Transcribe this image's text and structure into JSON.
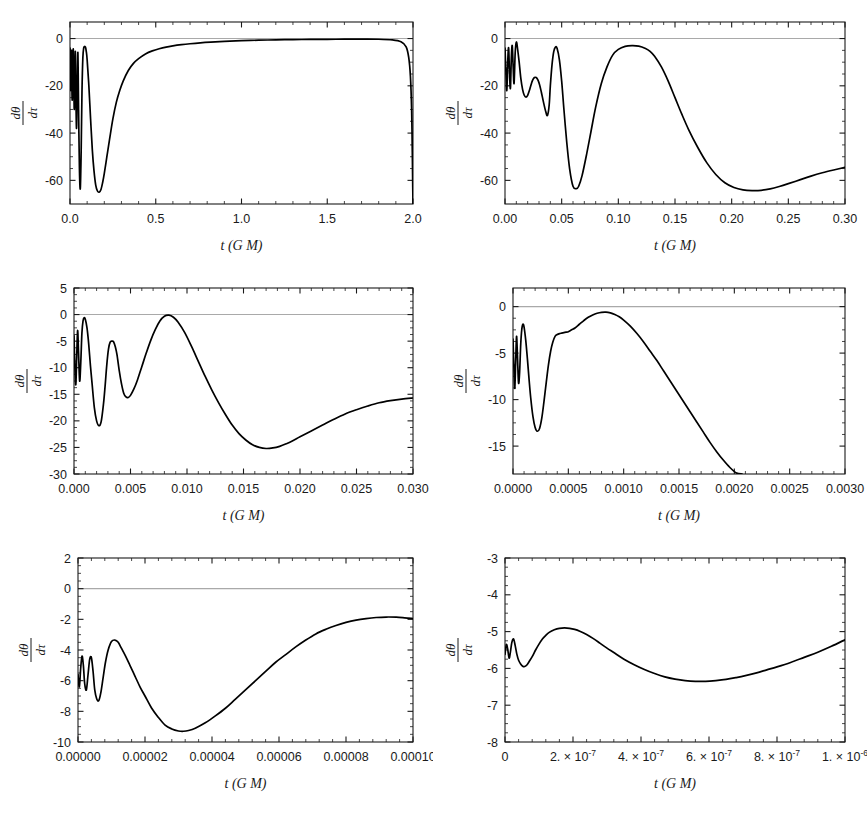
{
  "figure": {
    "background": "#ffffff",
    "curve_color": "#000000",
    "axis_color": "#1a1a1a",
    "zero_line_color": "#a9a9a9",
    "panel_count": 6,
    "layout": "3 rows x 2 columns"
  },
  "chart_data": [
    {
      "type": "line",
      "panel": 1,
      "title": "",
      "xlabel": "t (G M)",
      "ylabel_numerator": "dθ",
      "ylabel_denominator": "dτ",
      "ylabel": "dθ/dτ",
      "xlim": [
        0.0,
        2.0
      ],
      "ylim": [
        -70,
        7
      ],
      "xticks": [
        0.0,
        0.5,
        1.0,
        1.5,
        2.0
      ],
      "xticklabels": [
        "0.0",
        "0.5",
        "1.0",
        "1.5",
        "2.0"
      ],
      "yticks": [
        0,
        -20,
        -40,
        -60
      ],
      "yticklabels": [
        "0",
        "-20",
        "-40",
        "-60"
      ],
      "xminor_per_interval": 5,
      "yminor_per_interval": 4,
      "grid": false,
      "legend": null,
      "zero_line": 0,
      "x": [
        0.0,
        0.002,
        0.004,
        0.006,
        0.008,
        0.01,
        0.013,
        0.016,
        0.019,
        0.022,
        0.025,
        0.028,
        0.031,
        0.034,
        0.038,
        0.042,
        0.046,
        0.05,
        0.055,
        0.06,
        0.065,
        0.07,
        0.075,
        0.08,
        0.085,
        0.09,
        0.095,
        0.1,
        0.11,
        0.12,
        0.13,
        0.14,
        0.15,
        0.16,
        0.17,
        0.18,
        0.19,
        0.2,
        0.215,
        0.23,
        0.25,
        0.27,
        0.29,
        0.31,
        0.34,
        0.37,
        0.4,
        0.44,
        0.48,
        0.52,
        0.56,
        0.6,
        0.65,
        0.7,
        0.76,
        0.82,
        0.9,
        1.0,
        1.1,
        1.2,
        1.3,
        1.4,
        1.5,
        1.6,
        1.7,
        1.8,
        1.88,
        1.93,
        1.96,
        1.975,
        1.985,
        1.992,
        1.996,
        1.998,
        2.0
      ],
      "y": [
        -4.0,
        -12.0,
        -22.0,
        -14.0,
        -5.0,
        -16.0,
        -26.0,
        -12.0,
        -4.5,
        -18.0,
        -30.0,
        -16.0,
        -5.5,
        -22.0,
        -38.0,
        -20.0,
        -6.0,
        -30.0,
        -55.0,
        -63.5,
        -48.0,
        -22.0,
        -8.0,
        -4.0,
        -3.4,
        -3.6,
        -5.5,
        -9.0,
        -20.0,
        -34.0,
        -47.0,
        -56.0,
        -62.0,
        -64.5,
        -65.0,
        -64.0,
        -61.0,
        -57.0,
        -50.0,
        -43.0,
        -34.0,
        -27.0,
        -22.0,
        -18.0,
        -13.5,
        -10.5,
        -8.5,
        -6.5,
        -5.2,
        -4.3,
        -3.6,
        -3.1,
        -2.6,
        -2.2,
        -1.8,
        -1.5,
        -1.2,
        -0.9,
        -0.7,
        -0.55,
        -0.45,
        -0.38,
        -0.32,
        -0.28,
        -0.26,
        -0.3,
        -0.6,
        -1.4,
        -3.5,
        -8.0,
        -16.0,
        -30.0,
        -48.0,
        -60.0,
        -70.0
      ]
    },
    {
      "type": "line",
      "panel": 2,
      "title": "",
      "xlabel": "t (G M)",
      "ylabel_numerator": "dθ",
      "ylabel_denominator": "dτ",
      "ylabel": "dθ/dτ",
      "xlim": [
        0.0,
        0.3
      ],
      "ylim": [
        -70,
        7
      ],
      "xticks": [
        0.0,
        0.05,
        0.1,
        0.15,
        0.2,
        0.25,
        0.3
      ],
      "xticklabels": [
        "0.00",
        "0.05",
        "0.10",
        "0.15",
        "0.20",
        "0.25",
        "0.30"
      ],
      "yticks": [
        0,
        -20,
        -40,
        -60
      ],
      "yticklabels": [
        "0",
        "-20",
        "-40",
        "-60"
      ],
      "xminor_per_interval": 5,
      "yminor_per_interval": 4,
      "grid": false,
      "legend": null,
      "zero_line": 0,
      "x": [
        0.0,
        0.0008,
        0.0016,
        0.0024,
        0.0032,
        0.004,
        0.0048,
        0.0056,
        0.0064,
        0.0072,
        0.008,
        0.009,
        0.01,
        0.011,
        0.0125,
        0.014,
        0.0155,
        0.017,
        0.0185,
        0.02,
        0.0215,
        0.023,
        0.0245,
        0.026,
        0.0275,
        0.029,
        0.0305,
        0.032,
        0.034,
        0.036,
        0.0375,
        0.039,
        0.04,
        0.0415,
        0.043,
        0.0445,
        0.046,
        0.048,
        0.05,
        0.052,
        0.0545,
        0.057,
        0.06,
        0.063,
        0.065,
        0.068,
        0.072,
        0.076,
        0.08,
        0.085,
        0.09,
        0.095,
        0.1,
        0.106,
        0.112,
        0.118,
        0.124,
        0.128,
        0.132,
        0.138,
        0.144,
        0.15,
        0.156,
        0.162,
        0.17,
        0.178,
        0.186,
        0.194,
        0.202,
        0.21,
        0.218,
        0.226,
        0.234,
        0.242,
        0.25,
        0.26,
        0.27,
        0.28,
        0.29,
        0.3
      ],
      "y": [
        -4.0,
        -14.0,
        -22.0,
        -10.0,
        -4.0,
        -15.0,
        -21.0,
        -8.0,
        -3.0,
        -12.0,
        -19.0,
        -6.0,
        -1.5,
        -4.0,
        -10.0,
        -17.0,
        -21.5,
        -24.0,
        -24.8,
        -24.0,
        -22.0,
        -19.5,
        -17.5,
        -16.5,
        -16.5,
        -17.5,
        -19.5,
        -22.5,
        -27.0,
        -31.0,
        -32.5,
        -28.0,
        -20.0,
        -11.0,
        -5.5,
        -3.6,
        -4.2,
        -9.0,
        -18.0,
        -30.0,
        -44.0,
        -55.0,
        -62.5,
        -63.5,
        -62.5,
        -58.0,
        -49.0,
        -39.0,
        -29.0,
        -19.0,
        -12.0,
        -7.0,
        -4.6,
        -3.3,
        -3.0,
        -3.2,
        -4.2,
        -5.4,
        -7.5,
        -12.0,
        -18.0,
        -25.0,
        -32.0,
        -38.5,
        -46.0,
        -52.5,
        -57.5,
        -61.0,
        -63.0,
        -64.0,
        -64.3,
        -64.2,
        -63.6,
        -62.6,
        -61.4,
        -59.8,
        -58.2,
        -56.8,
        -55.6,
        -54.5
      ]
    },
    {
      "type": "line",
      "panel": 3,
      "title": "",
      "xlabel": "t (G M)",
      "ylabel_numerator": "dθ",
      "ylabel_denominator": "dτ",
      "ylabel": "dθ/dτ",
      "xlim": [
        0.0,
        0.03
      ],
      "ylim": [
        -30,
        5
      ],
      "xticks": [
        0.0,
        0.005,
        0.01,
        0.015,
        0.02,
        0.025,
        0.03
      ],
      "xticklabels": [
        "0.000",
        "0.005",
        "0.010",
        "0.015",
        "0.020",
        "0.025",
        "0.030"
      ],
      "yticks": [
        5,
        0,
        -5,
        -10,
        -15,
        -20,
        -25,
        -30
      ],
      "yticklabels": [
        "5",
        "0",
        "-5",
        "-10",
        "-15",
        "-20",
        "-25",
        "-30"
      ],
      "xminor_per_interval": 5,
      "yminor_per_interval": 4,
      "grid": false,
      "legend": null,
      "zero_line": 0,
      "x": [
        0.0,
        8e-05,
        0.00016,
        0.00024,
        0.00032,
        0.0004,
        0.0005,
        0.0006,
        0.0007,
        0.0008,
        0.0009,
        0.001,
        0.00115,
        0.0013,
        0.00145,
        0.0016,
        0.0018,
        0.002,
        0.0022,
        0.0024,
        0.0026,
        0.00275,
        0.0029,
        0.00305,
        0.0032,
        0.00335,
        0.0035,
        0.00365,
        0.0038,
        0.004,
        0.0042,
        0.0044,
        0.0046,
        0.0048,
        0.005,
        0.0053,
        0.0056,
        0.006,
        0.0064,
        0.0068,
        0.0072,
        0.0076,
        0.008,
        0.0084,
        0.0088,
        0.0092,
        0.0098,
        0.0104,
        0.011,
        0.0116,
        0.0122,
        0.0128,
        0.0134,
        0.014,
        0.0146,
        0.0152,
        0.0158,
        0.0164,
        0.017,
        0.0176,
        0.0182,
        0.0188,
        0.0194,
        0.02,
        0.021,
        0.022,
        0.023,
        0.024,
        0.025,
        0.026,
        0.027,
        0.028,
        0.029,
        0.03
      ],
      "y": [
        -4.0,
        -10.0,
        -13.2,
        -8.0,
        -3.0,
        -7.0,
        -12.5,
        -9.0,
        -3.5,
        -1.2,
        -0.6,
        -0.9,
        -2.5,
        -5.5,
        -9.5,
        -13.0,
        -17.5,
        -20.0,
        -20.9,
        -20.2,
        -17.0,
        -13.5,
        -9.5,
        -6.5,
        -5.2,
        -5.0,
        -5.1,
        -6.0,
        -7.5,
        -10.5,
        -13.0,
        -14.8,
        -15.5,
        -15.6,
        -15.2,
        -14.0,
        -12.4,
        -9.8,
        -7.2,
        -4.8,
        -2.8,
        -1.2,
        -0.3,
        -0.1,
        -0.5,
        -1.4,
        -3.4,
        -6.0,
        -8.8,
        -11.6,
        -14.2,
        -16.6,
        -18.8,
        -20.8,
        -22.4,
        -23.6,
        -24.5,
        -25.0,
        -25.2,
        -25.1,
        -24.8,
        -24.3,
        -23.7,
        -23.0,
        -21.9,
        -20.8,
        -19.7,
        -18.7,
        -17.9,
        -17.2,
        -16.6,
        -16.2,
        -15.9,
        -15.7
      ]
    },
    {
      "type": "line",
      "panel": 4,
      "title": "",
      "xlabel": "t (G M)",
      "ylabel_numerator": "dθ",
      "ylabel_denominator": "dτ",
      "ylabel": "dθ/dτ",
      "xlim": [
        0.0,
        0.003
      ],
      "ylim": [
        -18,
        2
      ],
      "xticks": [
        0.0,
        0.0005,
        0.001,
        0.0015,
        0.002,
        0.0025,
        0.003
      ],
      "xticklabels": [
        "0.0000",
        "0.0005",
        "0.0010",
        "0.0015",
        "0.0020",
        "0.0025",
        "0.0030"
      ],
      "yticks": [
        0,
        -5,
        -10,
        -15
      ],
      "yticklabels": [
        "0",
        "-5",
        "-10",
        "-15"
      ],
      "xminor_per_interval": 5,
      "yminor_per_interval": 4,
      "grid": false,
      "legend": null,
      "zero_line": 0,
      "x": [
        0.0,
        8e-06,
        1.6e-05,
        2.4e-05,
        3.2e-05,
        4e-05,
        5e-05,
        6e-05,
        7e-05,
        8e-05,
        9e-05,
        0.0001,
        0.000115,
        0.00013,
        0.000145,
        0.00016,
        0.00018,
        0.0002,
        0.00022,
        0.00024,
        0.00026,
        0.00028,
        0.0003,
        0.00032,
        0.00034,
        0.00036,
        0.00038,
        0.0004,
        0.00042,
        0.00044,
        0.00046,
        0.00048,
        0.0005,
        0.00053,
        0.00056,
        0.0006,
        0.00064,
        0.00068,
        0.00072,
        0.00076,
        0.0008,
        0.00084,
        0.00088,
        0.00092,
        0.00096,
        0.001,
        0.00106,
        0.00112,
        0.00118,
        0.00124,
        0.0013,
        0.00136,
        0.00142,
        0.00148,
        0.00154,
        0.0016,
        0.00166,
        0.00172,
        0.00178,
        0.00184,
        0.0019,
        0.00196,
        0.00202,
        0.00207
      ],
      "y": [
        -3.5,
        -6.5,
        -8.8,
        -6.0,
        -3.2,
        -5.2,
        -8.2,
        -7.0,
        -4.0,
        -2.4,
        -1.9,
        -2.2,
        -3.6,
        -5.6,
        -7.8,
        -9.8,
        -11.8,
        -13.0,
        -13.4,
        -13.1,
        -12.0,
        -10.2,
        -8.2,
        -6.3,
        -4.8,
        -3.8,
        -3.2,
        -3.0,
        -2.9,
        -2.85,
        -2.8,
        -2.75,
        -2.7,
        -2.5,
        -2.3,
        -1.9,
        -1.5,
        -1.15,
        -0.9,
        -0.72,
        -0.62,
        -0.6,
        -0.68,
        -0.85,
        -1.1,
        -1.45,
        -2.1,
        -2.9,
        -3.8,
        -4.8,
        -5.8,
        -6.9,
        -8.0,
        -9.1,
        -10.2,
        -11.3,
        -12.4,
        -13.5,
        -14.6,
        -15.6,
        -16.5,
        -17.3,
        -17.9,
        -18.0
      ]
    },
    {
      "type": "line",
      "panel": 5,
      "title": "",
      "xlabel": "t (G M)",
      "ylabel_numerator": "dθ",
      "ylabel_denominator": "dτ",
      "ylabel": "dθ/dτ",
      "xlim": [
        0.0,
        0.0001
      ],
      "ylim": [
        -10,
        2
      ],
      "xticks": [
        0.0,
        2e-05,
        4e-05,
        6e-05,
        8e-05,
        0.0001
      ],
      "xticklabels": [
        "0.00000",
        "0.00002",
        "0.00004",
        "0.00006",
        "0.00008",
        "0.00010"
      ],
      "yticks": [
        2,
        0,
        -2,
        -4,
        -6,
        -8,
        -10
      ],
      "yticklabels": [
        "2",
        "0",
        "-2",
        "-4",
        "-6",
        "-8",
        "-10"
      ],
      "xminor_per_interval": 5,
      "yminor_per_interval": 4,
      "grid": false,
      "legend": null,
      "zero_line": 0,
      "x": [
        0.0,
        4e-07,
        8e-07,
        1.2e-06,
        1.6e-06,
        2e-06,
        2.5e-06,
        3e-06,
        3.5e-06,
        4e-06,
        4.5e-06,
        5e-06,
        5.6e-06,
        6.2e-06,
        6.8e-06,
        7.5e-06,
        8.2e-06,
        9e-06,
        1e-05,
        1.1e-05,
        1.2e-05,
        1.3e-05,
        1.42e-05,
        1.55e-05,
        1.7e-05,
        1.85e-05,
        2e-05,
        2.2e-05,
        2.4e-05,
        2.6e-05,
        2.8e-05,
        3e-05,
        3.15e-05,
        3.3e-05,
        3.5e-05,
        3.8e-05,
        4.1e-05,
        4.4e-05,
        4.7e-05,
        5e-05,
        5.3e-05,
        5.6e-05,
        5.9e-05,
        6.2e-05,
        6.5e-05,
        6.8e-05,
        7.1e-05,
        7.4e-05,
        7.7e-05,
        8e-05,
        8.3e-05,
        8.6e-05,
        8.9e-05,
        9.2e-05,
        9.5e-05,
        9.75e-05,
        0.0001
      ],
      "y": [
        -5.6,
        -6.4,
        -5.2,
        -4.4,
        -5.0,
        -6.2,
        -6.6,
        -5.6,
        -4.6,
        -4.5,
        -5.4,
        -6.6,
        -7.2,
        -7.3,
        -6.8,
        -5.8,
        -4.8,
        -4.0,
        -3.45,
        -3.35,
        -3.5,
        -3.9,
        -4.4,
        -5.0,
        -5.7,
        -6.4,
        -7.0,
        -7.8,
        -8.4,
        -8.9,
        -9.15,
        -9.28,
        -9.3,
        -9.25,
        -9.1,
        -8.75,
        -8.3,
        -7.8,
        -7.2,
        -6.6,
        -6.0,
        -5.4,
        -4.8,
        -4.3,
        -3.8,
        -3.35,
        -2.95,
        -2.65,
        -2.4,
        -2.2,
        -2.05,
        -1.95,
        -1.88,
        -1.85,
        -1.86,
        -1.9,
        -1.95
      ]
    },
    {
      "type": "line",
      "panel": 6,
      "title": "",
      "xlabel": "t (G M)",
      "ylabel_numerator": "dθ",
      "ylabel_denominator": "dτ",
      "ylabel": "dθ/dτ",
      "xlim": [
        0.0,
        1e-06
      ],
      "ylim": [
        -8,
        -3
      ],
      "xticks": [
        0,
        2e-07,
        4e-07,
        6e-07,
        8e-07,
        1e-06
      ],
      "xticklabels": [
        "0",
        "2. × 10",
        "4. × 10",
        "6. × 10",
        "8. × 10",
        "1. × 10"
      ],
      "xtickexponents": [
        "",
        "-7",
        "-7",
        "-7",
        "-7",
        "-6"
      ],
      "yticks": [
        -3,
        -4,
        -5,
        -6,
        -7,
        -8
      ],
      "yticklabels": [
        "-3",
        "-4",
        "-5",
        "-6",
        "-7",
        "-8"
      ],
      "xminor_per_interval": 5,
      "yminor_per_interval": 4,
      "grid": false,
      "legend": null,
      "zero_line": null,
      "x": [
        0.0,
        4e-09,
        8e-09,
        1.2e-08,
        1.6e-08,
        2e-08,
        2.5e-08,
        3e-08,
        3.5e-08,
        4e-08,
        4.6e-08,
        5.2e-08,
        5.8e-08,
        6.5e-08,
        7.2e-08,
        8e-08,
        9e-08,
        1e-07,
        1.1e-07,
        1.2e-07,
        1.3e-07,
        1.45e-07,
        1.6e-07,
        1.75e-07,
        1.9e-07,
        2.05e-07,
        2.2e-07,
        2.4e-07,
        2.6e-07,
        2.8e-07,
        3e-07,
        3.2e-07,
        3.5e-07,
        3.8e-07,
        4.1e-07,
        4.4e-07,
        4.7e-07,
        5e-07,
        5.3e-07,
        5.6e-07,
        5.9e-07,
        6.2e-07,
        6.5e-07,
        6.8e-07,
        7.1e-07,
        7.4e-07,
        7.7e-07,
        8e-07,
        8.4e-07,
        8.8e-07,
        9.2e-07,
        9.6e-07,
        1e-06
      ],
      "y": [
        -5.62,
        -5.35,
        -5.48,
        -5.72,
        -5.55,
        -5.3,
        -5.2,
        -5.38,
        -5.62,
        -5.78,
        -5.88,
        -5.94,
        -5.95,
        -5.9,
        -5.8,
        -5.68,
        -5.5,
        -5.34,
        -5.2,
        -5.1,
        -5.02,
        -4.95,
        -4.91,
        -4.9,
        -4.91,
        -4.94,
        -4.99,
        -5.08,
        -5.19,
        -5.32,
        -5.45,
        -5.57,
        -5.75,
        -5.9,
        -6.03,
        -6.14,
        -6.23,
        -6.29,
        -6.33,
        -6.35,
        -6.35,
        -6.33,
        -6.3,
        -6.25,
        -6.19,
        -6.12,
        -6.04,
        -5.96,
        -5.84,
        -5.7,
        -5.56,
        -5.4,
        -5.22
      ]
    }
  ]
}
